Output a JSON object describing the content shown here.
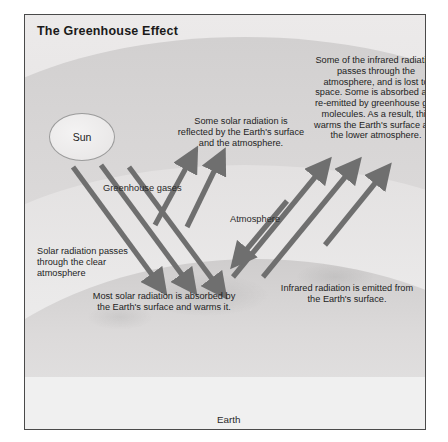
{
  "figure": {
    "title": "The Greenhouse Effect",
    "sun_label": "Sun",
    "atmosphere_label": "Atmosphere",
    "greenhouse_gases_label": "Greenhouse gases",
    "earth_label": "Earth",
    "annotations": {
      "solar_reflected": "Some solar radiation is reflected by the Earth's surface and the atmosphere.",
      "infrared_escape": "Some of the infrared radiation passes through the atmosphere, and is lost to space. Some is absorbed and re-emitted by greenhouse gas molecules. As a result, this warms the Earth's surface and the lower atmosphere.",
      "solar_passes": "Solar radiation passes through the clear atmosphere",
      "most_absorbed": "Most solar radiation is absorbed by the Earth's surface and warms it.",
      "infrared_emitted": "Infrared radiation is emitted from the Earth's surface."
    },
    "colors": {
      "border": "#4a4a4a",
      "background": "#e9e9e9",
      "arrow": "#6f6f6f",
      "text": "#1d1d1d"
    }
  }
}
